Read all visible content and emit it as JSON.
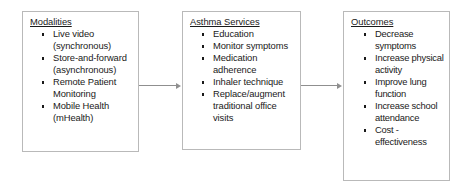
{
  "diagram": {
    "boxes": [
      {
        "id": "modalities",
        "title": "Modalities",
        "items": [
          "Live video (synchronous)",
          "Store-and-forward (asynchronous)",
          "Remote Patient Monitoring",
          "Mobile Health (mHealth)"
        ]
      },
      {
        "id": "asthma-services",
        "title": "Asthma Services",
        "items": [
          "Education",
          "Monitor symptoms",
          "Medication adherence",
          "Inhaler technique",
          "Replace/augment traditional office visits"
        ]
      },
      {
        "id": "outcomes",
        "title": "Outcomes",
        "items": [
          "Decrease symptoms",
          "Increase physical activity",
          "Improve lung function",
          "Increase school attendance",
          "Cost - effectiveness"
        ]
      }
    ],
    "connectors": [
      {
        "id": "arrow-modalities-to-services",
        "from": "modalities",
        "to": "asthma-services",
        "glyph": "arrow-right"
      },
      {
        "id": "arrow-services-to-outcomes",
        "from": "asthma-services",
        "to": "outcomes",
        "glyph": "arrow-right"
      }
    ],
    "colors": {
      "box_border": "#b9b9b9",
      "arrow": "#8f8f8f",
      "text": "#1a1a1a",
      "background": "#ffffff"
    }
  }
}
